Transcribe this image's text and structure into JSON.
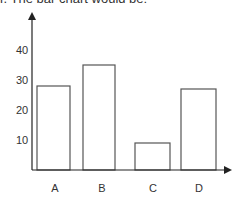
{
  "caption": "r. The bar chart would be:",
  "chart_data": {
    "type": "bar",
    "title": "",
    "xlabel": "",
    "ylabel": "",
    "categories": [
      "A",
      "B",
      "C",
      "D"
    ],
    "values": [
      28,
      35,
      9,
      27
    ],
    "ylim": [
      0,
      50
    ],
    "yticks": [
      10,
      20,
      30,
      40
    ],
    "grid": false,
    "legend": null
  },
  "colors": {
    "axis": "#222222",
    "bar_stroke": "#555555",
    "bar_fill": "#ffffff"
  }
}
